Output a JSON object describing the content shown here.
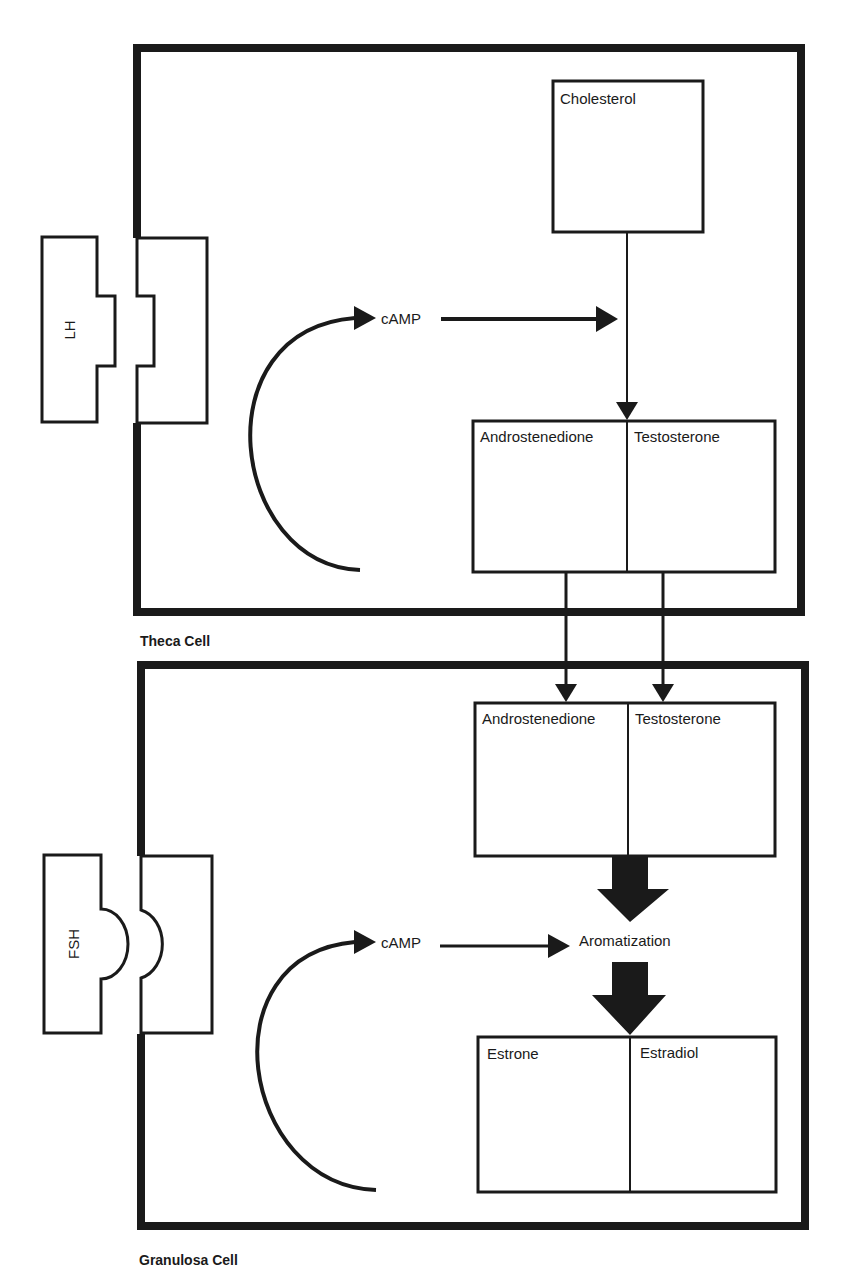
{
  "diagram": {
    "theca": {
      "caption": "Theca Cell",
      "receptor_hormone": "LH",
      "second_messenger": "cAMP",
      "precursor": "Cholesterol",
      "products": [
        "Androstenedione",
        "Testosterone"
      ]
    },
    "granulosa": {
      "caption": "Granulosa Cell",
      "receptor_hormone": "FSH",
      "second_messenger": "cAMP",
      "substrates": [
        "Androstenedione",
        "Testosterone"
      ],
      "process": "Aromatization",
      "products": [
        "Estrone",
        "Estradiol"
      ]
    },
    "colors": {
      "ink": "#1a1a1a",
      "background": "#ffffff"
    }
  }
}
